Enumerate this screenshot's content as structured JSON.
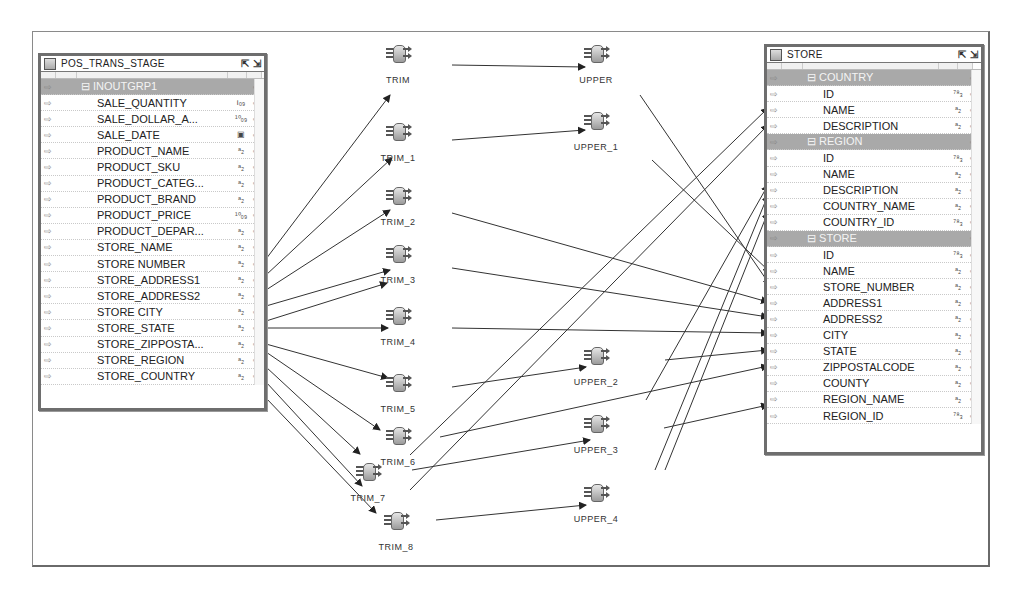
{
  "source_table": {
    "title": "POS_TRANS_STAGE",
    "group": "INOUTGRP1",
    "rows": [
      {
        "name": "SALE_QUANTITY",
        "type": "int"
      },
      {
        "name": "SALE_DOLLAR_A...",
        "type": "dec"
      },
      {
        "name": "SALE_DATE",
        "type": "date"
      },
      {
        "name": "PRODUCT_NAME",
        "type": "str"
      },
      {
        "name": "PRODUCT_SKU",
        "type": "str"
      },
      {
        "name": "PRODUCT_CATEG...",
        "type": "str"
      },
      {
        "name": "PRODUCT_BRAND",
        "type": "str"
      },
      {
        "name": "PRODUCT_PRICE",
        "type": "dec"
      },
      {
        "name": "PRODUCT_DEPAR...",
        "type": "str"
      },
      {
        "name": "STORE_NAME",
        "type": "str"
      },
      {
        "name": "STORE NUMBER",
        "type": "str"
      },
      {
        "name": "STORE_ADDRESS1",
        "type": "str"
      },
      {
        "name": "STORE_ADDRESS2",
        "type": "str"
      },
      {
        "name": "STORE CITY",
        "type": "str"
      },
      {
        "name": "STORE_STATE",
        "type": "str"
      },
      {
        "name": "STORE_ZIPPOSTA...",
        "type": "str"
      },
      {
        "name": "STORE_REGION",
        "type": "str"
      },
      {
        "name": "STORE_COUNTRY",
        "type": "str"
      }
    ]
  },
  "target_table": {
    "title": "STORE",
    "groups": [
      {
        "name": "COUNTRY",
        "rows": [
          {
            "name": "ID",
            "type": "num"
          },
          {
            "name": "NAME",
            "type": "str"
          },
          {
            "name": "DESCRIPTION",
            "type": "str"
          }
        ]
      },
      {
        "name": "REGION",
        "rows": [
          {
            "name": "ID",
            "type": "num"
          },
          {
            "name": "NAME",
            "type": "str"
          },
          {
            "name": "DESCRIPTION",
            "type": "str"
          },
          {
            "name": "COUNTRY_NAME",
            "type": "str"
          },
          {
            "name": "COUNTRY_ID",
            "type": "num"
          }
        ]
      },
      {
        "name": "STORE",
        "rows": [
          {
            "name": "ID",
            "type": "num"
          },
          {
            "name": "NAME",
            "type": "str"
          },
          {
            "name": "STORE_NUMBER",
            "type": "str"
          },
          {
            "name": "ADDRESS1",
            "type": "str"
          },
          {
            "name": "ADDRESS2",
            "type": "str"
          },
          {
            "name": "CITY",
            "type": "str"
          },
          {
            "name": "STATE",
            "type": "str"
          },
          {
            "name": "ZIPPOSTALCODE",
            "type": "str"
          },
          {
            "name": "COUNTY",
            "type": "str"
          },
          {
            "name": "REGION_NAME",
            "type": "str"
          },
          {
            "name": "REGION_ID",
            "type": "num"
          }
        ]
      }
    ]
  },
  "transforms": {
    "trim": [
      "TRIM",
      "TRIM_1",
      "TRIM_2",
      "TRIM_3",
      "TRIM_4",
      "TRIM_5",
      "TRIM_6",
      "TRIM_7",
      "TRIM_8"
    ],
    "upper": [
      "UPPER",
      "UPPER_1",
      "UPPER_2",
      "UPPER_3",
      "UPPER_4"
    ]
  },
  "type_glyphs": {
    "int": "i₀₉",
    "dec": "¹⁰₀₉",
    "date": "▣",
    "str": "ᵃ₂",
    "num": "⁷⁸₃"
  },
  "colors": {
    "group_row": "#a9a9a9",
    "border": "#6e6e6e",
    "line": "#333333"
  }
}
